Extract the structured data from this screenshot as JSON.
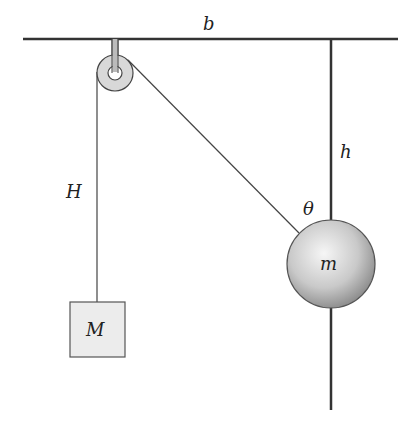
{
  "diagram": {
    "type": "physics-pulley-system",
    "labels": {
      "ceiling_length": "b",
      "rod_length": "h",
      "hanging_length": "H",
      "angle": "θ",
      "ball_mass": "m",
      "block_mass": "M"
    },
    "colors": {
      "line": "#333333",
      "pulley_fill": "#d8d8d8",
      "block_fill": "#ececec",
      "ball_light": "#f4f4f4",
      "ball_dark": "#8a8a8a"
    }
  }
}
